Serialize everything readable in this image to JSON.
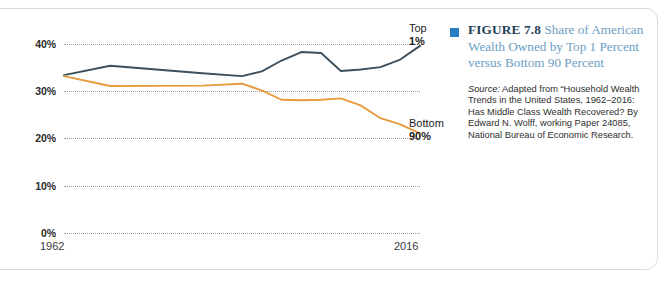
{
  "figure": {
    "marker_color": "#2b7dc3",
    "number_label": "FIGURE 7.8",
    "title": "Share of American Wealth Owned by Top 1 Percent versus Bottom 90 Percent",
    "source_label": "Source:",
    "source_text": " Adapted from “Household Wealth Trends in the United States, 1962–2016: Has Middle Class Wealth Recovered? By Edward N. Wolff, working Paper 24085, National Bureau of Economic Research."
  },
  "chart_data": {
    "type": "line",
    "title": "Share of American Wealth Owned by Top 1 Percent versus Bottom 90 Percent",
    "xlabel": "",
    "ylabel": "",
    "ylim": [
      0,
      40
    ],
    "xlim": [
      1962,
      2016
    ],
    "grid": true,
    "legend_position": "inline-right",
    "ytick_labels": [
      "0%",
      "10%",
      "20%",
      "30%",
      "40%"
    ],
    "ytick_values": [
      0,
      10,
      20,
      30,
      40
    ],
    "xtick_labels": [
      "1962",
      "2016"
    ],
    "xtick_values": [
      1962,
      2016
    ],
    "x": [
      1962,
      1969,
      1983,
      1989,
      1992,
      1995,
      1998,
      2001,
      2004,
      2007,
      2010,
      2013,
      2016
    ],
    "series": [
      {
        "name": "Top 1%",
        "label_line1": "Top",
        "label_line2": "1%",
        "color": "#3d4f5c",
        "values": [
          33.4,
          35.4,
          33.8,
          33.2,
          34.2,
          36.5,
          38.3,
          38.1,
          34.3,
          34.6,
          35.1,
          36.7,
          39.6
        ]
      },
      {
        "name": "Bottom 90%",
        "label_line1": "Bottom",
        "label_line2": "90%",
        "color": "#e89b3c",
        "values": [
          33.2,
          31.1,
          31.2,
          31.6,
          30.2,
          28.2,
          28.1,
          28.2,
          28.5,
          27.0,
          24.3,
          23.0,
          21.1
        ]
      }
    ]
  }
}
